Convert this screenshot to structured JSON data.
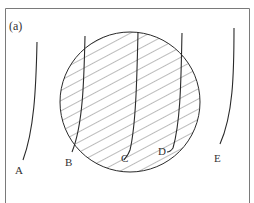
{
  "figure": {
    "panel_label": "(a)",
    "colors": {
      "frame": "#7a7a7a",
      "stroke": "#2a2a2a",
      "hatch": "#555555",
      "text": "#333333",
      "background": "#ffffff"
    },
    "circle": {
      "cx": 130,
      "cy": 102,
      "r": 70,
      "fill": "diagonal-hatch"
    },
    "curves": [
      {
        "id": "A",
        "label": "A",
        "label_x": 15,
        "label_y": 174
      },
      {
        "id": "B",
        "label": "B",
        "label_x": 65,
        "label_y": 166
      },
      {
        "id": "C",
        "label": "C",
        "label_x": 121,
        "label_y": 162
      },
      {
        "id": "D",
        "label": "D",
        "label_x": 158,
        "label_y": 155
      },
      {
        "id": "E",
        "label": "E",
        "label_x": 214,
        "label_y": 162
      }
    ]
  }
}
